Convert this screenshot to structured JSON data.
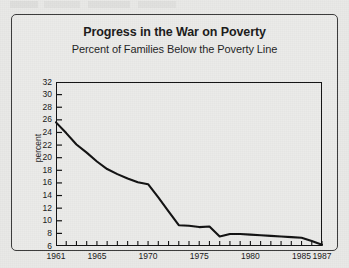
{
  "document": {
    "page_background": "#e9e9e7",
    "frame_border_color": "#3a3a3a"
  },
  "chart_data": {
    "type": "line",
    "title": "Progress in the War on Poverty",
    "subtitle": "Percent of Families Below the Poverty Line",
    "xlabel": "",
    "ylabel": "percent",
    "xlim": [
      1961,
      1987
    ],
    "ylim": [
      6,
      32
    ],
    "ytick_step": 2,
    "yticks": [
      6,
      8,
      10,
      12,
      14,
      16,
      18,
      20,
      22,
      24,
      26,
      28,
      30,
      32
    ],
    "ytick_labels": [
      "6",
      "8",
      "10",
      "12",
      "14",
      "16",
      "18",
      "20",
      "22",
      "24",
      "26",
      "28",
      "30",
      "32"
    ],
    "xticks": [
      1961,
      1962,
      1963,
      1964,
      1965,
      1966,
      1967,
      1968,
      1969,
      1970,
      1971,
      1972,
      1973,
      1974,
      1975,
      1976,
      1977,
      1978,
      1979,
      1980,
      1981,
      1982,
      1983,
      1984,
      1985,
      1986,
      1987
    ],
    "xtick_labels": [
      "1961",
      "1965",
      "1970",
      "1975",
      "1980",
      "1985",
      "1987"
    ],
    "xtick_label_years": [
      1961,
      1965,
      1970,
      1975,
      1980,
      1985,
      1987
    ],
    "grid": false,
    "legend": false,
    "line_color": "#111111",
    "line_width": 2.1,
    "x": [
      1961,
      1962,
      1963,
      1964,
      1965,
      1966,
      1967,
      1968,
      1969,
      1970,
      1971,
      1972,
      1973,
      1974,
      1975,
      1976,
      1977,
      1978,
      1979,
      1980,
      1981,
      1982,
      1983,
      1984,
      1985,
      1986,
      1987
    ],
    "values": [
      25.6,
      23.9,
      22.1,
      20.8,
      19.4,
      18.2,
      17.4,
      16.7,
      16.1,
      15.8,
      13.7,
      11.5,
      9.3,
      9.2,
      9.0,
      9.1,
      7.5,
      7.9,
      7.9,
      7.8,
      7.7,
      7.6,
      7.5,
      7.4,
      7.3,
      6.8,
      6.2
    ]
  }
}
